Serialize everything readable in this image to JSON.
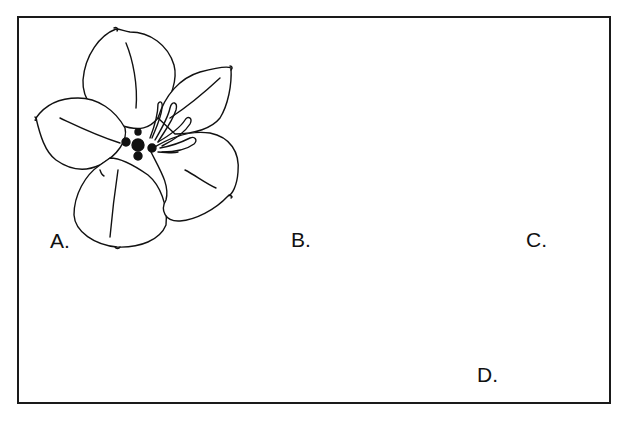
{
  "figure": {
    "panels": [
      {
        "id": "A",
        "label": "A.",
        "subject": "flower (top view, five petals with stamens)"
      },
      {
        "id": "B",
        "label": "B.",
        "subject": "palmately lobed leaf (stippled)"
      },
      {
        "id": "C",
        "label": "C.",
        "subject": "flower bud with calyx/bracts on stalk"
      },
      {
        "id": "D",
        "label": "D.",
        "subject": "elongated seed pod / fruit"
      }
    ],
    "colors": {
      "ink": "#111111",
      "background": "#ffffff",
      "border": "#1a1a1a"
    }
  }
}
